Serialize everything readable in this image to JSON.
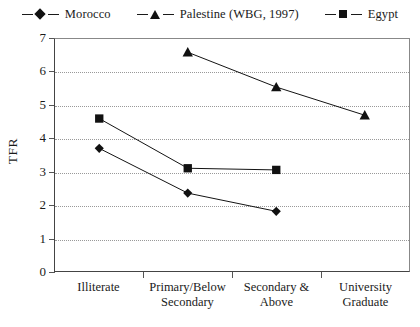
{
  "chart_data": {
    "type": "line",
    "title": "",
    "xlabel": "",
    "ylabel": "TFR",
    "ylim": [
      0,
      7
    ],
    "ytick_labels": [
      "0",
      "1",
      "2",
      "3",
      "4",
      "5",
      "6",
      "7"
    ],
    "grid": true,
    "legend_position": "top-center",
    "categories": [
      "Illiterate",
      "Primary/Below Secondary",
      "Secondary & Above",
      "University Graduate"
    ],
    "category_lines": [
      [
        "Illiterate"
      ],
      [
        "Primary/Below",
        "Secondary"
      ],
      [
        "Secondary &",
        "Above"
      ],
      [
        "University",
        "Graduate"
      ]
    ],
    "series": [
      {
        "name": "Morocco",
        "marker": "diamond-marker",
        "color": "#111111",
        "values": [
          3.7,
          2.35,
          1.8,
          null
        ]
      },
      {
        "name": "Palestine (WBG, 1997)",
        "marker": "triangle-marker",
        "color": "#111111",
        "values": [
          null,
          6.6,
          5.55,
          4.7
        ]
      },
      {
        "name": "Egypt",
        "marker": "square-marker",
        "color": "#111111",
        "values": [
          4.6,
          3.1,
          3.05,
          null
        ]
      }
    ]
  },
  "legend": {
    "entries": [
      {
        "label": "Morocco",
        "marker": "diamond-marker"
      },
      {
        "label": "Palestine (WBG, 1997)",
        "marker": "triangle-marker"
      },
      {
        "label": "Egypt",
        "marker": "square-marker"
      }
    ]
  },
  "axes": {
    "y_title": "TFR"
  }
}
